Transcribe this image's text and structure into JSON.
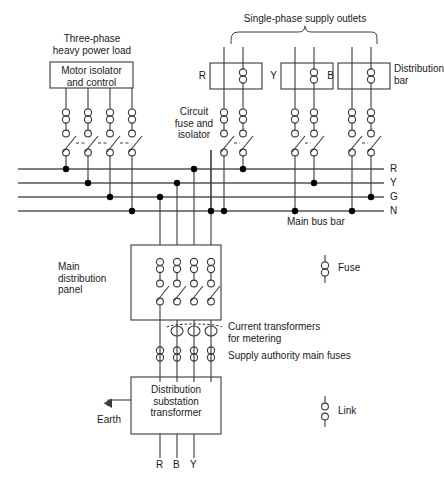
{
  "diagram": {
    "title_alt": "Electrical distribution system single-line diagram",
    "colors": {
      "line": "#3a3a3a",
      "busbar": "#555555",
      "node": "#000000",
      "text": "#1a1a1a",
      "background": "#ffffff"
    },
    "labels": {
      "three_phase_load_line1": "Three-phase",
      "three_phase_load_line2": "heavy power load",
      "motor_isolator_line1": "Motor isolator",
      "motor_isolator_line2": "and control",
      "single_phase_outlets": "Single-phase supply outlets",
      "circuit_fuse_line1": "Circuit",
      "circuit_fuse_line2": "fuse and",
      "circuit_fuse_line3": "isolator",
      "distribution_bar_line1": "Distribution",
      "distribution_bar_line2": "bar",
      "main_bus_bar": "Main bus bar",
      "main_distribution_line1": "Main",
      "main_distribution_line2": "distribution",
      "main_distribution_line3": "panel",
      "current_transformers_line1": "Current transformers",
      "current_transformers_line2": "for metering",
      "supply_authority_fuses": "Supply authority main fuses",
      "substation_line1": "Distribution",
      "substation_line2": "substation",
      "substation_line3": "transformer",
      "earth": "Earth",
      "legend_fuse": "Fuse",
      "legend_link": "Link"
    },
    "busbars": [
      {
        "name": "R",
        "label": "R",
        "y": 169
      },
      {
        "name": "Y",
        "label": "Y",
        "y": 183
      },
      {
        "name": "G",
        "label": "G",
        "y": 197
      },
      {
        "name": "N",
        "label": "N",
        "y": 211
      }
    ],
    "distribution_bars": [
      {
        "phase": "R",
        "label": "R"
      },
      {
        "phase": "Y",
        "label": "Y"
      },
      {
        "phase": "B",
        "label": "B"
      }
    ],
    "transformer_outputs": [
      {
        "label": "R"
      },
      {
        "label": "B"
      },
      {
        "label": "Y"
      }
    ],
    "legend": [
      {
        "symbol": "fuse",
        "label": "Fuse"
      },
      {
        "symbol": "link",
        "label": "Link"
      }
    ]
  }
}
